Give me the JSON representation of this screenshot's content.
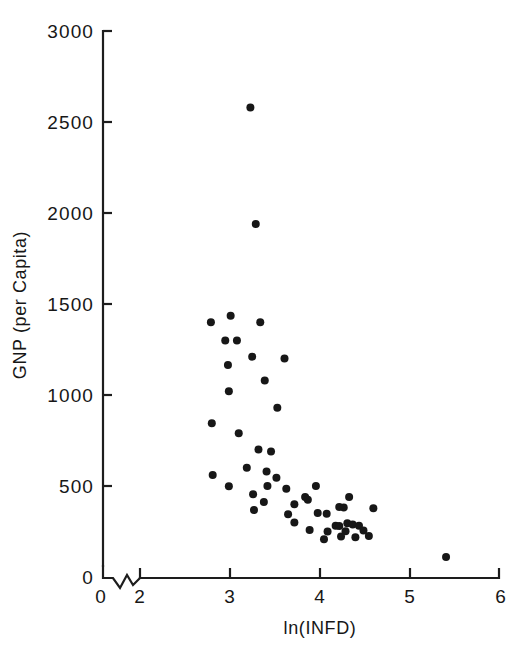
{
  "chart_data": {
    "type": "scatter",
    "title": "",
    "xlabel": "ln(INFD)",
    "ylabel": "GNP (per Capita)",
    "xlim": [
      1.6,
      6.0
    ],
    "ylim": [
      0,
      3000
    ],
    "grid": false,
    "legend": null,
    "x_ticks": [
      {
        "value": 0,
        "label": "0",
        "px": 101
      },
      {
        "value": 2,
        "label": "2",
        "px": 140
      },
      {
        "value": 3,
        "label": "3",
        "px": 230
      },
      {
        "value": 4,
        "label": "4",
        "px": 320
      },
      {
        "value": 5,
        "label": "5",
        "px": 410
      },
      {
        "value": 6,
        "label": "6",
        "px": 499
      }
    ],
    "y_ticks": [
      {
        "value": 0,
        "label": "0",
        "px": 577
      },
      {
        "value": 500,
        "label": "500",
        "px": 486
      },
      {
        "value": 1000,
        "label": "1000",
        "px": 395
      },
      {
        "value": 1500,
        "label": "1500",
        "px": 304
      },
      {
        "value": 2000,
        "label": "2000",
        "px": 213
      },
      {
        "value": 2500,
        "label": "2500",
        "px": 122
      },
      {
        "value": 3000,
        "label": "3000",
        "px": 31
      }
    ],
    "axis_break": {
      "present": true,
      "between": [
        0,
        2
      ],
      "style": "zigzag"
    },
    "marker": {
      "shape": "circle",
      "radius_px": 4.0,
      "color": "#171717"
    },
    "points": [
      {
        "x": 3.23,
        "y": 2580
      },
      {
        "x": 3.29,
        "y": 1940
      },
      {
        "x": 2.79,
        "y": 1400
      },
      {
        "x": 3.01,
        "y": 1435
      },
      {
        "x": 3.34,
        "y": 1400
      },
      {
        "x": 2.95,
        "y": 1300
      },
      {
        "x": 3.08,
        "y": 1300
      },
      {
        "x": 3.25,
        "y": 1210
      },
      {
        "x": 3.61,
        "y": 1200
      },
      {
        "x": 2.98,
        "y": 1165
      },
      {
        "x": 3.39,
        "y": 1080
      },
      {
        "x": 2.99,
        "y": 1020
      },
      {
        "x": 3.53,
        "y": 930
      },
      {
        "x": 2.8,
        "y": 845
      },
      {
        "x": 3.1,
        "y": 790
      },
      {
        "x": 3.32,
        "y": 700
      },
      {
        "x": 3.46,
        "y": 690
      },
      {
        "x": 3.19,
        "y": 600
      },
      {
        "x": 3.41,
        "y": 580
      },
      {
        "x": 2.81,
        "y": 560
      },
      {
        "x": 3.52,
        "y": 545
      },
      {
        "x": 2.99,
        "y": 498
      },
      {
        "x": 3.42,
        "y": 500
      },
      {
        "x": 3.63,
        "y": 485
      },
      {
        "x": 3.26,
        "y": 455
      },
      {
        "x": 3.96,
        "y": 500
      },
      {
        "x": 3.84,
        "y": 440
      },
      {
        "x": 3.87,
        "y": 425
      },
      {
        "x": 3.38,
        "y": 412
      },
      {
        "x": 3.72,
        "y": 400
      },
      {
        "x": 4.33,
        "y": 440
      },
      {
        "x": 3.27,
        "y": 368
      },
      {
        "x": 3.65,
        "y": 345
      },
      {
        "x": 4.22,
        "y": 385
      },
      {
        "x": 4.27,
        "y": 382
      },
      {
        "x": 3.98,
        "y": 352
      },
      {
        "x": 4.08,
        "y": 348
      },
      {
        "x": 3.72,
        "y": 300
      },
      {
        "x": 4.6,
        "y": 378
      },
      {
        "x": 4.31,
        "y": 295
      },
      {
        "x": 4.18,
        "y": 282
      },
      {
        "x": 4.22,
        "y": 280
      },
      {
        "x": 4.37,
        "y": 288
      },
      {
        "x": 4.44,
        "y": 282
      },
      {
        "x": 3.89,
        "y": 258
      },
      {
        "x": 4.09,
        "y": 250
      },
      {
        "x": 4.29,
        "y": 252
      },
      {
        "x": 4.49,
        "y": 255
      },
      {
        "x": 4.24,
        "y": 222
      },
      {
        "x": 4.4,
        "y": 218
      },
      {
        "x": 4.55,
        "y": 225
      },
      {
        "x": 4.05,
        "y": 208
      },
      {
        "x": 5.41,
        "y": 110
      }
    ]
  },
  "axes": {
    "x_axis_name": "ln(INFD)",
    "y_axis_name": "GNP (per Capita)"
  }
}
